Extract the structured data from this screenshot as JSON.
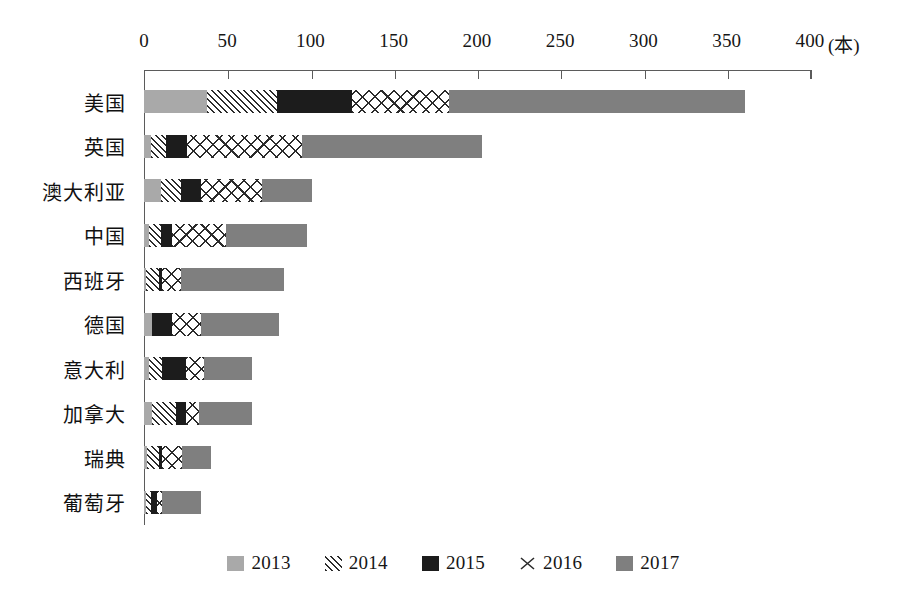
{
  "chart_data": {
    "type": "bar",
    "orientation": "horizontal",
    "stacked": true,
    "title": "",
    "subtitle": "",
    "xlabel": "(本)",
    "ylabel": "",
    "xlim": [
      0,
      400
    ],
    "xticks": [
      0,
      50,
      100,
      150,
      200,
      250,
      300,
      350,
      400
    ],
    "xtick_labels": [
      "0",
      "50",
      "100",
      "150",
      "200",
      "250",
      "300",
      "350",
      "400"
    ],
    "unit_label": "(本)",
    "grid": false,
    "legend_position": "bottom",
    "categories": [
      "美国",
      "英国",
      "澳大利亚",
      "中国",
      "西班牙",
      "德国",
      "意大利",
      "加拿大",
      "瑞典",
      "葡萄牙"
    ],
    "series": [
      {
        "name": "2013",
        "color": "#a9a9a9",
        "pattern": "solid-light-gray",
        "values": [
          38,
          4,
          10,
          3,
          1,
          5,
          3,
          5,
          2,
          1
        ]
      },
      {
        "name": "2014",
        "color": "#2b2b2b",
        "pattern": "diagonal-hatch",
        "values": [
          42,
          9,
          12,
          7,
          8,
          0,
          8,
          14,
          7,
          3
        ]
      },
      {
        "name": "2015",
        "color": "#1c1c1c",
        "pattern": "solid-black",
        "values": [
          45,
          13,
          12,
          7,
          2,
          12,
          14,
          6,
          2,
          4
        ]
      },
      {
        "name": "2016",
        "color": "#2b2b2b",
        "pattern": "cross-hatch",
        "values": [
          58,
          69,
          37,
          32,
          11,
          17,
          11,
          8,
          12,
          3
        ]
      },
      {
        "name": "2017",
        "color": "#7f7f7f",
        "pattern": "solid-gray",
        "values": [
          178,
          108,
          30,
          49,
          62,
          47,
          29,
          32,
          17,
          23
        ]
      }
    ],
    "totals": [
      361,
      203,
      101,
      98,
      84,
      81,
      65,
      65,
      40,
      34
    ]
  },
  "legend": {
    "items": [
      {
        "label": "2013",
        "swatch": "solid-light-gray-swatch"
      },
      {
        "label": "2014",
        "swatch": "diagonal-hatch-swatch"
      },
      {
        "label": "2015",
        "swatch": "solid-black-swatch"
      },
      {
        "label": "2016",
        "swatch": "cross-hatch-swatch"
      },
      {
        "label": "2017",
        "swatch": "solid-gray-swatch"
      }
    ]
  },
  "colors": {
    "series_2013": "#a9a9a9",
    "series_2015": "#1c1c1c",
    "series_2017": "#7f7f7f",
    "hatch_ink": "#2b2b2b",
    "axis": "#5b5b5b",
    "text": "#161616",
    "background": "#ffffff"
  }
}
